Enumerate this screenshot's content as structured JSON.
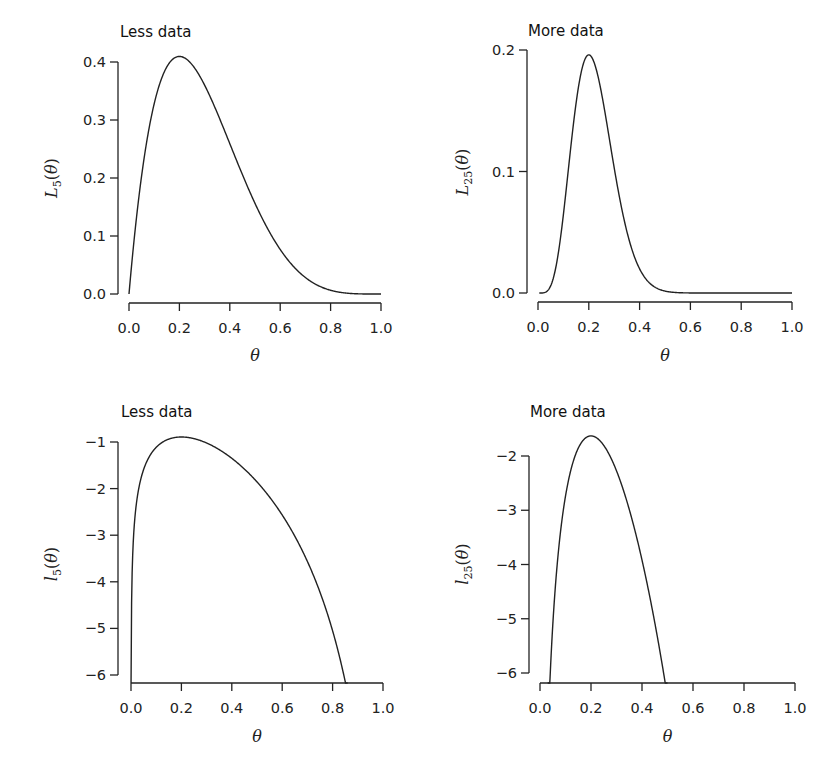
{
  "chart_data": [
    {
      "type": "line",
      "title": "Less data",
      "xlabel": "θ",
      "ylabel": "L5(θ)",
      "ylabel_main": "L",
      "ylabel_sub": "5",
      "ylabel_tail": "(θ)",
      "xlim": [
        0,
        1
      ],
      "ylim": [
        0,
        0.4
      ],
      "x_ticks": [
        "0.0",
        "0.2",
        "0.4",
        "0.6",
        "0.8",
        "1.0"
      ],
      "y_ticks": [
        "0.0",
        "0.1",
        "0.2",
        "0.3",
        "0.4"
      ],
      "grid": false,
      "series": [
        {
          "name": "L5",
          "x": [
            0,
            0.05,
            0.1,
            0.15,
            0.2,
            0.3,
            0.4,
            0.5,
            0.6,
            0.7,
            0.8,
            0.9,
            1.0
          ],
          "values": [
            0,
            0.204,
            0.328,
            0.392,
            0.41,
            0.36,
            0.259,
            0.156,
            0.077,
            0.028,
            0.006,
            0.0005,
            0
          ]
        }
      ]
    },
    {
      "type": "line",
      "title": "More data",
      "xlabel": "θ",
      "ylabel": "L25(θ)",
      "ylabel_main": "L",
      "ylabel_sub": "25",
      "ylabel_tail": "(θ)",
      "xlim": [
        0,
        1
      ],
      "ylim": [
        0,
        0.2
      ],
      "x_ticks": [
        "0.0",
        "0.2",
        "0.4",
        "0.6",
        "0.8",
        "1.0"
      ],
      "y_ticks": [
        "0.0",
        "0.1",
        "0.2"
      ],
      "grid": false,
      "series": [
        {
          "name": "L25",
          "x": [
            0,
            0.05,
            0.1,
            0.15,
            0.2,
            0.25,
            0.3,
            0.35,
            0.4,
            0.5,
            0.6,
            1.0
          ],
          "values": [
            0,
            0.004,
            0.07,
            0.163,
            0.196,
            0.165,
            0.103,
            0.052,
            0.021,
            0.002,
            0.0001,
            0
          ]
        }
      ]
    },
    {
      "type": "line",
      "title": "Less data",
      "xlabel": "θ",
      "ylabel": "l5(θ)",
      "ylabel_main": "l",
      "ylabel_sub": "5",
      "ylabel_tail": "(θ)",
      "xlim": [
        0,
        1
      ],
      "ylim": [
        -6.2,
        -1
      ],
      "x_ticks": [
        "0.0",
        "0.2",
        "0.4",
        "0.6",
        "0.8",
        "1.0"
      ],
      "y_ticks": [
        "−1",
        "−2",
        "−3",
        "−4",
        "−5",
        "−6"
      ],
      "grid": false,
      "series": [
        {
          "name": "l5",
          "x": [
            0.002,
            0.01,
            0.05,
            0.1,
            0.2,
            0.3,
            0.4,
            0.5,
            0.6,
            0.7,
            0.8,
            0.85
          ],
          "values": [
            -4.6,
            -2.99,
            -1.59,
            -1.11,
            -0.89,
            -1.02,
            -1.35,
            -1.86,
            -2.56,
            -3.59,
            -5.21,
            -6.15
          ]
        }
      ]
    },
    {
      "type": "line",
      "title": "More data",
      "xlabel": "θ",
      "ylabel": "l25(θ)",
      "ylabel_main": "l",
      "ylabel_sub": "25",
      "ylabel_tail": "(θ)",
      "xlim": [
        0,
        1
      ],
      "ylim": [
        -6.2,
        -2
      ],
      "x_ticks": [
        "0.0",
        "0.2",
        "0.4",
        "0.6",
        "0.8",
        "1.0"
      ],
      "y_ticks": [
        "−2",
        "−3",
        "−4",
        "−5",
        "−6"
      ],
      "grid": false,
      "series": [
        {
          "name": "l25",
          "x": [
            0.04,
            0.05,
            0.1,
            0.15,
            0.2,
            0.25,
            0.3,
            0.35,
            0.4,
            0.45,
            0.49
          ],
          "values": [
            -6.2,
            -5.5,
            -2.66,
            -1.81,
            -1.63,
            -1.8,
            -2.27,
            -2.96,
            -3.86,
            -4.98,
            -6.2
          ]
        }
      ]
    }
  ]
}
